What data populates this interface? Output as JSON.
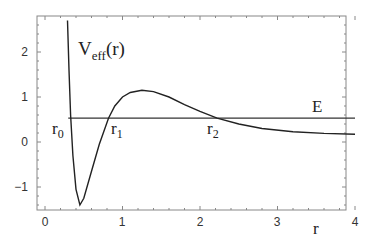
{
  "chart_data": {
    "type": "line",
    "title": "",
    "xlabel": "r",
    "ylabel": "",
    "xlim": [
      -0.1,
      4.1
    ],
    "ylim": [
      -1.5,
      2.7
    ],
    "grid": false,
    "x_ticks": [
      "0",
      "1",
      "2",
      "3",
      "4"
    ],
    "y_ticks": [
      "−1",
      "0",
      "1",
      "2"
    ],
    "series": [
      {
        "name": "V_eff(r)",
        "label_main": "V",
        "label_sub": "eff",
        "label_tail": "(r)",
        "points": [
          [
            0.29,
            2.7
          ],
          [
            0.31,
            1.6
          ],
          [
            0.33,
            0.6
          ],
          [
            0.36,
            -0.3
          ],
          [
            0.4,
            -1.05
          ],
          [
            0.45,
            -1.4
          ],
          [
            0.5,
            -1.25
          ],
          [
            0.6,
            -0.65
          ],
          [
            0.7,
            -0.05
          ],
          [
            0.82,
            0.53
          ],
          [
            0.9,
            0.8
          ],
          [
            1.0,
            1.0
          ],
          [
            1.1,
            1.1
          ],
          [
            1.25,
            1.15
          ],
          [
            1.4,
            1.12
          ],
          [
            1.6,
            1.0
          ],
          [
            1.8,
            0.83
          ],
          [
            2.0,
            0.68
          ],
          [
            2.22,
            0.53
          ],
          [
            2.5,
            0.4
          ],
          [
            2.8,
            0.3
          ],
          [
            3.2,
            0.23
          ],
          [
            3.6,
            0.19
          ],
          [
            4.0,
            0.17
          ]
        ]
      },
      {
        "name": "E",
        "label": "E",
        "value": 0.53,
        "x_range": [
          0.3,
          4.0
        ]
      }
    ],
    "annotations": [
      {
        "text": "r",
        "sub": "0",
        "x": 0.05,
        "y": 0.35
      },
      {
        "text": "r",
        "sub": "1",
        "x": 0.82,
        "y": 0.35
      },
      {
        "text": "r",
        "sub": "2",
        "x": 2.2,
        "y": 0.35
      }
    ]
  },
  "labels": {
    "veff_main": "V",
    "veff_sub": "eff",
    "veff_tail": "(r)",
    "energy": "E",
    "r0_main": "r",
    "r0_sub": "0",
    "r1_main": "r",
    "r1_sub": "1",
    "r2_main": "r",
    "r2_sub": "2",
    "xaxis": "r",
    "xt0": "0",
    "xt1": "1",
    "xt2": "2",
    "xt3": "3",
    "xt4": "4",
    "ytm1": "−1",
    "yt0": "0",
    "yt1": "1",
    "yt2": "2"
  }
}
